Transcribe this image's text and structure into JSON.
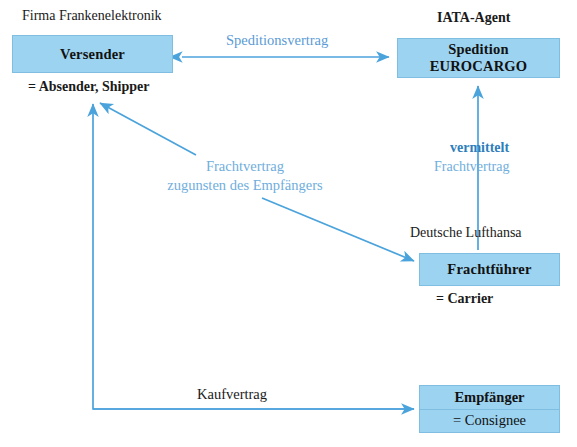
{
  "diagram": {
    "accent_color": "#4BA3DC",
    "box_fill": "#9CD3F0",
    "box_border": "#7FBEE0",
    "label_color": "#5B9BD5"
  },
  "captions": {
    "firma": "Firma Frankenelektronik",
    "iata_agent": "IATA-Agent",
    "absender_shipper": "= Absender, Shipper",
    "deutsche_lufthansa": "Deutsche Lufthansa",
    "carrier": "= Carrier"
  },
  "boxes": {
    "versender": {
      "label": "Versender"
    },
    "spedition": {
      "line1": "Spedition",
      "line2": "EUROCARGO"
    },
    "frachtfuehrer": {
      "label": "Frachtführer"
    },
    "empfaenger": {
      "label": "Empfänger",
      "sublabel": "= Consignee"
    }
  },
  "edge_labels": {
    "speditionsvertrag": "Speditionsvertrag",
    "vermittelt": "vermittelt",
    "frachtvertrag_right": "Frachtvertrag",
    "frachtvertrag_left_line1": "Frachtvertrag",
    "frachtvertrag_left_line2": "zugunsten des Empfängers",
    "kaufvertrag": "Kaufvertrag"
  }
}
